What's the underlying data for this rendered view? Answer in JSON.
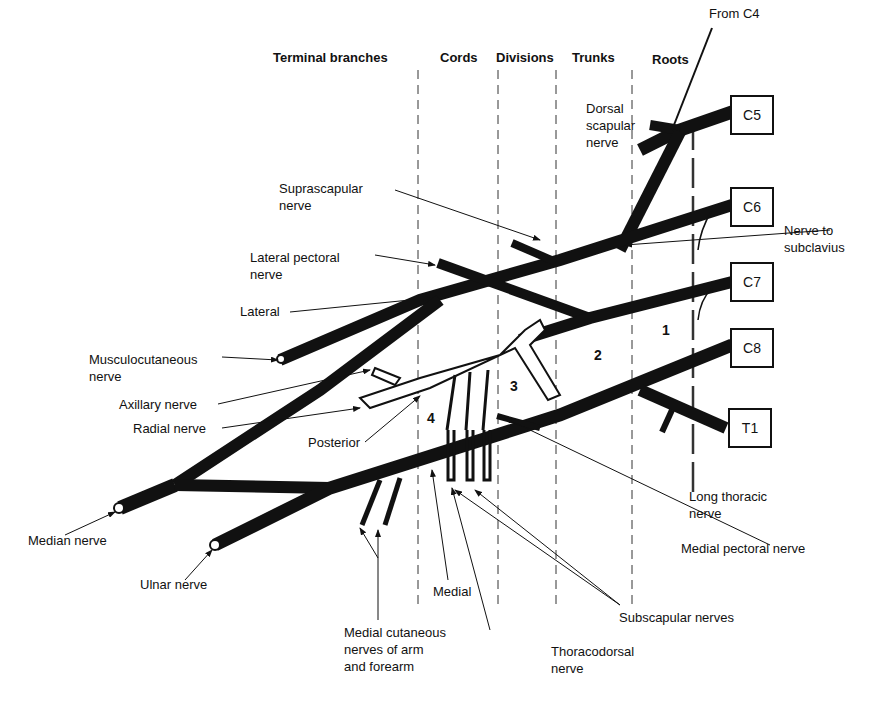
{
  "headers": {
    "terminal_branches": "Terminal branches",
    "cords": "Cords",
    "divisions": "Divisions",
    "trunks": "Trunks",
    "roots": "Roots"
  },
  "roots": [
    "C5",
    "C6",
    "C7",
    "C8",
    "T1"
  ],
  "region_numbers": [
    "1",
    "2",
    "3",
    "4"
  ],
  "labels": {
    "from_c4": "From C4",
    "dorsal_scapular": "Dorsal\nscapular\nnerve",
    "suprascapular": "Suprascapular\nnerve",
    "nerve_to_subclavius": "Nerve to\nsubclavius",
    "lateral_pectoral": "Lateral pectoral\nnerve",
    "lateral": "Lateral",
    "musculocutaneous": "Musculocutaneous\nnerve",
    "axillary": "Axillary nerve",
    "radial": "Radial nerve",
    "posterior": "Posterior",
    "median": "Median nerve",
    "ulnar": "Ulnar nerve",
    "medial_cutaneous": "Medial cutaneous\nnerves of arm\nand forearm",
    "medial": "Medial",
    "thoracodorsal": "Thoracodorsal\nnerve",
    "subscapular": "Subscapular nerves",
    "medial_pectoral": "Medial pectoral nerve",
    "long_thoracic": "Long thoracic\nnerve"
  }
}
